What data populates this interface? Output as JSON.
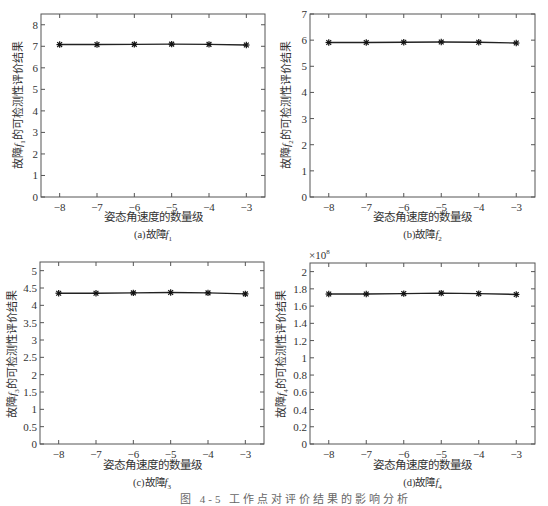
{
  "figure_caption": "图 4-5 工作点对评价结果的影响分析",
  "chart_data": [
    {
      "id": "a",
      "type": "line",
      "title": "",
      "caption": "(a)故障f1",
      "caption_main": "(a)故障",
      "caption_f": "f",
      "caption_sub": "1",
      "xlabel": "姿态角速度的数量级",
      "ylabel": "故障f1的可检测性评价结果",
      "ylabel_pre": "故障",
      "ylabel_f": "f",
      "ylabel_sub": "1",
      "ylabel_post": "的可检测性评价结果",
      "x": [
        -8,
        -7,
        -6,
        -5,
        -4,
        -3
      ],
      "values": [
        7.08,
        7.08,
        7.09,
        7.1,
        7.09,
        7.06
      ],
      "xlim": [
        -8.5,
        -2.5
      ],
      "ylim": [
        0,
        8.5
      ],
      "xticks": [
        -8,
        -7,
        -6,
        -5,
        -4,
        -3
      ],
      "xtick_labels": [
        "−8",
        "−7",
        "−6",
        "−5",
        "−4",
        "−3"
      ],
      "yticks": [
        0,
        1,
        2,
        3,
        4,
        5,
        6,
        7,
        8
      ],
      "ytick_labels": [
        "0",
        "1",
        "2",
        "3",
        "4",
        "5",
        "6",
        "7",
        "8"
      ],
      "exponent": "",
      "marker": "asterisk",
      "line_color": "#222222",
      "grid": false,
      "legend": "none"
    },
    {
      "id": "b",
      "type": "line",
      "title": "",
      "caption": "(b)故障f2",
      "caption_main": "(b)故障",
      "caption_f": "f",
      "caption_sub": "2",
      "xlabel": "姿态角速度的数量级",
      "ylabel": "故障f2的可检测性评价结果",
      "ylabel_pre": "故障",
      "ylabel_f": "f",
      "ylabel_sub": "2",
      "ylabel_post": "的可检测性评价结果",
      "x": [
        -8,
        -7,
        -6,
        -5,
        -4,
        -3
      ],
      "values": [
        5.91,
        5.91,
        5.92,
        5.93,
        5.92,
        5.89
      ],
      "xlim": [
        -8.5,
        -2.5
      ],
      "ylim": [
        0,
        7
      ],
      "xticks": [
        -8,
        -7,
        -6,
        -5,
        -4,
        -3
      ],
      "xtick_labels": [
        "−8",
        "−7",
        "−6",
        "−5",
        "−4",
        "−3"
      ],
      "yticks": [
        0,
        1,
        2,
        3,
        4,
        5,
        6,
        7
      ],
      "ytick_labels": [
        "0",
        "1",
        "2",
        "3",
        "4",
        "5",
        "6",
        "7"
      ],
      "exponent": "",
      "marker": "asterisk",
      "line_color": "#222222",
      "grid": false,
      "legend": "none"
    },
    {
      "id": "c",
      "type": "line",
      "title": "",
      "caption": "(c)故障f3",
      "caption_main": "(c)故障",
      "caption_f": "f",
      "caption_sub": "3",
      "xlabel": "姿态角速度的数量级",
      "ylabel": "故障f3的可检测性评价结果",
      "ylabel_pre": "故障",
      "ylabel_f": "f",
      "ylabel_sub": "3",
      "ylabel_post": "的可检测性评价结果",
      "x": [
        -8,
        -7,
        -6,
        -5,
        -4,
        -3
      ],
      "values": [
        4.35,
        4.35,
        4.36,
        4.37,
        4.36,
        4.33
      ],
      "xlim": [
        -8.5,
        -2.5
      ],
      "ylim": [
        0,
        5.25
      ],
      "xticks": [
        -8,
        -7,
        -6,
        -5,
        -4,
        -3
      ],
      "xtick_labels": [
        "−8",
        "−7",
        "−6",
        "−5",
        "−4",
        "−3"
      ],
      "yticks": [
        0,
        0.5,
        1,
        1.5,
        2,
        2.5,
        3,
        3.5,
        4,
        4.5,
        5
      ],
      "ytick_labels": [
        "0",
        "0.5",
        "1",
        "1.5",
        "2",
        "2.5",
        "3",
        "3.5",
        "4",
        "4.5",
        "5"
      ],
      "exponent": "",
      "marker": "asterisk",
      "line_color": "#222222",
      "grid": false,
      "legend": "none"
    },
    {
      "id": "d",
      "type": "line",
      "title": "",
      "caption": "(d)故障f4",
      "caption_main": "(d)故障",
      "caption_f": "f",
      "caption_sub": "4",
      "xlabel": "姿态角速度的数量级",
      "ylabel": "故障f4的可检测性评价结果",
      "ylabel_pre": "故障",
      "ylabel_f": "f",
      "ylabel_sub": "4",
      "ylabel_post": "的可检测性评价结果",
      "x": [
        -8,
        -7,
        -6,
        -5,
        -4,
        -3
      ],
      "values": [
        1.74,
        1.74,
        1.745,
        1.75,
        1.745,
        1.735
      ],
      "values_scale": "×10^8",
      "xlim": [
        -8.5,
        -2.5
      ],
      "ylim": [
        0,
        2.1
      ],
      "xticks": [
        -8,
        -7,
        -6,
        -5,
        -4,
        -3
      ],
      "xtick_labels": [
        "−8",
        "−7",
        "−6",
        "−5",
        "−4",
        "−3"
      ],
      "yticks": [
        0,
        0.2,
        0.4,
        0.6,
        0.8,
        1,
        1.2,
        1.4,
        1.6,
        1.8,
        2
      ],
      "ytick_labels": [
        "0",
        "0.2",
        "0.4",
        "0.6",
        "0.8",
        "1",
        "1.2",
        "1.4",
        "1.6",
        "1.8",
        "2"
      ],
      "exponent": "×10",
      "exponent_power": "8",
      "marker": "asterisk",
      "line_color": "#222222",
      "grid": false,
      "legend": "none"
    }
  ]
}
